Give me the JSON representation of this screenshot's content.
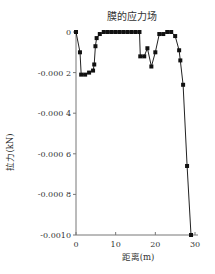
{
  "chart_data": {
    "type": "line",
    "title": "膜的应力场",
    "xlabel": "距离(m)",
    "ylabel": "拉力(kN)",
    "xlim": [
      0,
      30
    ],
    "ylim": [
      -0.001,
      0
    ],
    "x_ticks": [
      "0",
      "10",
      "20",
      "30"
    ],
    "y_ticks": [
      "0",
      "-0.000 2",
      "-0.000 4",
      "-0.000 6",
      "-0.000 8",
      "-0.0010"
    ],
    "grid": false,
    "legend": null,
    "marker": "square",
    "series": [
      {
        "name": "膜的应力场",
        "x": [
          0,
          1,
          1.3,
          2.3,
          3.3,
          4.3,
          4.6,
          4.9,
          5.2,
          6,
          7,
          8,
          9,
          10,
          11,
          12,
          13,
          14,
          15,
          16,
          16.2,
          17.2,
          18,
          19,
          20,
          21,
          22,
          23,
          24,
          25,
          26,
          26.3,
          27,
          28,
          29
        ],
        "y": [
          0,
          -0.0001,
          -0.00021,
          -0.00021,
          -0.0002,
          -0.00019,
          -0.00016,
          -7e-05,
          -3e-05,
          -1e-05,
          0,
          0,
          0,
          0,
          0,
          0,
          0,
          0,
          0,
          0,
          -0.00012,
          -0.00012,
          -8e-05,
          -0.00017,
          -0.0001,
          -1e-05,
          -1e-05,
          0,
          0,
          -2e-05,
          -9e-05,
          -0.00014,
          -0.00026,
          -0.00066,
          -0.001
        ]
      }
    ]
  }
}
